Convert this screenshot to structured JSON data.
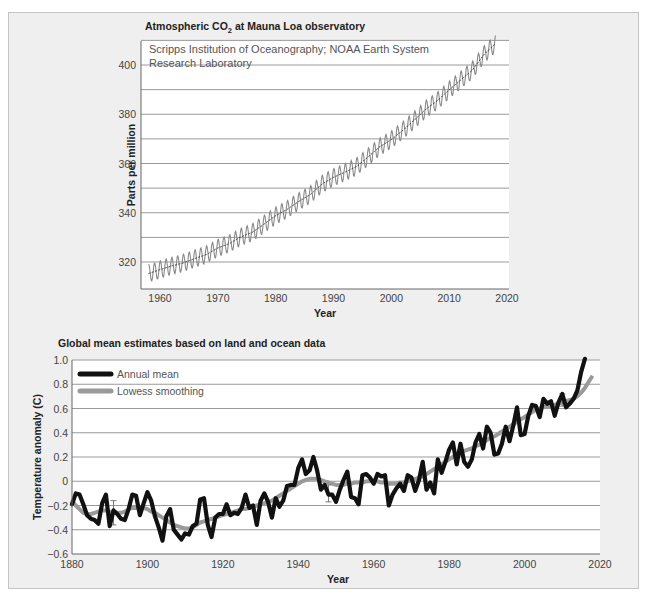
{
  "chart_data": [
    {
      "type": "line",
      "title": "Atmospheric CO2 at Mauna Loa observatory",
      "subtitle": "Scripps Institution of Oceanography; NOAA Earth System Research Laboratory",
      "xlabel": "Year",
      "ylabel": "Parts per million",
      "xlim": [
        1957,
        2020
      ],
      "ylim": [
        310,
        410
      ],
      "xticks": [
        1960,
        1970,
        1980,
        1990,
        2000,
        2010,
        2020
      ],
      "yticks": [
        320,
        340,
        360,
        380,
        400
      ],
      "grid": true,
      "series": [
        {
          "name": "Monthly CO2 (seasonal cycle)",
          "x": [
            1958,
            1960,
            1962,
            1964,
            1966,
            1968,
            1970,
            1972,
            1974,
            1976,
            1978,
            1980,
            1982,
            1984,
            1986,
            1988,
            1990,
            1992,
            1994,
            1996,
            1998,
            2000,
            2002,
            2004,
            2006,
            2008,
            2010,
            2012,
            2014,
            2016,
            2018
          ],
          "values": [
            315.3,
            316.9,
            318.4,
            319.6,
            321.4,
            323.0,
            325.7,
            327.5,
            330.2,
            332.1,
            335.4,
            338.8,
            341.4,
            344.6,
            347.4,
            351.6,
            354.4,
            356.5,
            358.8,
            362.7,
            366.8,
            369.7,
            373.5,
            377.7,
            382.1,
            385.6,
            389.9,
            393.9,
            397.9,
            404.2,
            408.7
          ]
        }
      ],
      "seasonal_amplitude_ppm": 3.5
    },
    {
      "type": "line",
      "title": "Global mean estimates based on land and ocean data",
      "xlabel": "Year",
      "ylabel": "Temperature anomaly (C)",
      "xlim": [
        1880,
        2020
      ],
      "ylim": [
        -0.6,
        1.0
      ],
      "xticks": [
        1880,
        1900,
        1920,
        1940,
        1960,
        1980,
        2000,
        2020
      ],
      "yticks": [
        -0.6,
        -0.4,
        -0.2,
        0,
        0.2,
        0.4,
        0.6,
        0.8,
        1.0
      ],
      "yticklabels": [
        "−0.6",
        "−0.4",
        "−0.2",
        "0",
        "0.2",
        "0.4",
        "0.6",
        "0.8",
        "1.0"
      ],
      "grid": true,
      "legend": {
        "position": "upper-left",
        "entries": [
          "Annual mean",
          "Lowess smoothing"
        ]
      },
      "series": [
        {
          "name": "Annual mean",
          "color": "#111111",
          "x_start": 1880,
          "values": [
            -0.19,
            -0.1,
            -0.11,
            -0.19,
            -0.28,
            -0.31,
            -0.32,
            -0.35,
            -0.18,
            -0.11,
            -0.37,
            -0.24,
            -0.27,
            -0.31,
            -0.32,
            -0.23,
            -0.11,
            -0.12,
            -0.28,
            -0.18,
            -0.09,
            -0.16,
            -0.29,
            -0.38,
            -0.49,
            -0.29,
            -0.23,
            -0.4,
            -0.44,
            -0.48,
            -0.43,
            -0.44,
            -0.37,
            -0.35,
            -0.15,
            -0.14,
            -0.36,
            -0.46,
            -0.3,
            -0.27,
            -0.27,
            -0.19,
            -0.28,
            -0.26,
            -0.27,
            -0.22,
            -0.11,
            -0.22,
            -0.2,
            -0.36,
            -0.16,
            -0.1,
            -0.17,
            -0.3,
            -0.14,
            -0.21,
            -0.16,
            -0.04,
            -0.03,
            -0.03,
            0.11,
            0.18,
            0.06,
            0.09,
            0.2,
            0.09,
            -0.07,
            -0.03,
            -0.11,
            -0.11,
            -0.17,
            -0.07,
            0.01,
            0.08,
            -0.13,
            -0.14,
            -0.19,
            0.05,
            0.06,
            0.03,
            -0.02,
            0.06,
            0.04,
            0.05,
            -0.2,
            -0.11,
            -0.06,
            -0.02,
            -0.08,
            0.05,
            0.03,
            -0.08,
            0.01,
            0.16,
            -0.07,
            -0.01,
            -0.1,
            0.18,
            0.07,
            0.16,
            0.26,
            0.32,
            0.14,
            0.31,
            0.16,
            0.12,
            0.18,
            0.32,
            0.39,
            0.27,
            0.45,
            0.4,
            0.22,
            0.23,
            0.31,
            0.45,
            0.33,
            0.46,
            0.61,
            0.38,
            0.39,
            0.54,
            0.63,
            0.62,
            0.53,
            0.68,
            0.64,
            0.66,
            0.54,
            0.65,
            0.72,
            0.61,
            0.64,
            0.68,
            0.75,
            0.9,
            1.01
          ]
        },
        {
          "name": "Lowess smoothing",
          "color": "#9a9a9a",
          "x_start": 1880,
          "values": [
            -0.16,
            -0.2,
            -0.23,
            -0.26,
            -0.27,
            -0.27,
            -0.26,
            -0.25,
            -0.24,
            -0.24,
            -0.25,
            -0.26,
            -0.26,
            -0.26,
            -0.25,
            -0.23,
            -0.22,
            -0.22,
            -0.22,
            -0.22,
            -0.23,
            -0.25,
            -0.26,
            -0.28,
            -0.3,
            -0.32,
            -0.34,
            -0.36,
            -0.37,
            -0.38,
            -0.39,
            -0.39,
            -0.38,
            -0.36,
            -0.34,
            -0.33,
            -0.32,
            -0.31,
            -0.3,
            -0.29,
            -0.28,
            -0.27,
            -0.26,
            -0.25,
            -0.24,
            -0.23,
            -0.23,
            -0.22,
            -0.21,
            -0.2,
            -0.19,
            -0.18,
            -0.17,
            -0.16,
            -0.14,
            -0.12,
            -0.1,
            -0.08,
            -0.06,
            -0.04,
            -0.02,
            0.0,
            0.01,
            0.02,
            0.02,
            0.02,
            0.01,
            0.0,
            -0.01,
            -0.02,
            -0.03,
            -0.03,
            -0.03,
            -0.02,
            -0.02,
            -0.01,
            -0.01,
            -0.01,
            0.0,
            0.0,
            0.0,
            0.0,
            -0.01,
            -0.01,
            -0.02,
            -0.02,
            -0.02,
            -0.01,
            -0.01,
            0.0,
            0.01,
            0.02,
            0.03,
            0.04,
            0.06,
            0.08,
            0.1,
            0.12,
            0.14,
            0.16,
            0.18,
            0.2,
            0.22,
            0.23,
            0.25,
            0.26,
            0.27,
            0.29,
            0.3,
            0.32,
            0.34,
            0.36,
            0.37,
            0.39,
            0.41,
            0.43,
            0.45,
            0.47,
            0.49,
            0.51,
            0.53,
            0.55,
            0.57,
            0.59,
            0.6,
            0.61,
            0.62,
            0.62,
            0.63,
            0.64,
            0.65,
            0.66,
            0.67,
            0.68,
            0.7,
            0.73,
            0.77,
            0.82,
            0.87
          ]
        }
      ],
      "error_bars": [
        {
          "x": 1891,
          "low": -0.36,
          "high": -0.16
        },
        {
          "x": 1948,
          "low": -0.17,
          "high": -0.03
        },
        {
          "x": 2010,
          "low": 0.62,
          "high": 0.72
        }
      ]
    }
  ],
  "labels": {
    "co2_title_prefix": "Atmospheric CO",
    "co2_title_sub": "2",
    "co2_title_suffix": " at Mauna Loa observatory",
    "co2_source_line1": "Scripps Institution of Oceanography; NOAA Earth System",
    "co2_source_line2": "Research Laboratory"
  }
}
